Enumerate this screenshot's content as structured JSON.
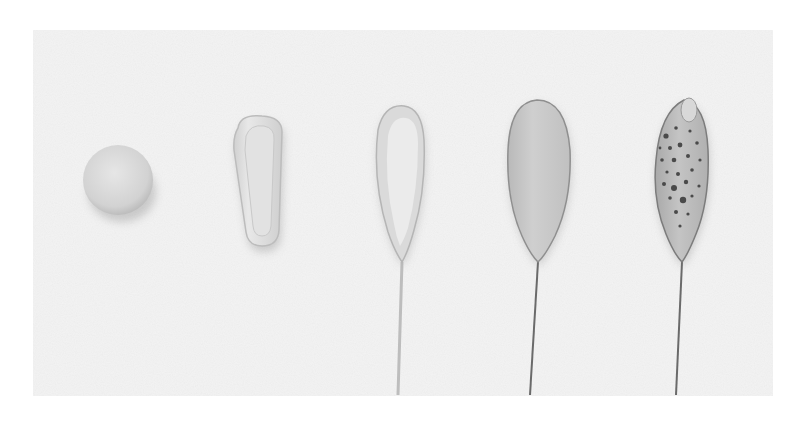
{
  "image": {
    "kind": "grayscale photograph",
    "subject": "five progressive stages of forming a petal on a wire",
    "background_color": "#f3f3f3",
    "page_color": "#ffffff",
    "stages": [
      {
        "step": 1,
        "shape": "ball",
        "cx": 118,
        "cy": 180,
        "r": 35,
        "fill": "#d9d9d9"
      },
      {
        "step": 2,
        "shape": "cupped-oblong",
        "x": 232,
        "y": 116,
        "w": 50,
        "h": 128,
        "fill": "#dedede"
      },
      {
        "step": 3,
        "shape": "hollowed-teardrop-on-wire",
        "cx": 396,
        "top": 106,
        "bottom": 262,
        "w": 54,
        "fill": "#e0e0e0",
        "wire_bottom": 395
      },
      {
        "step": 4,
        "shape": "flat-teardrop-on-wire",
        "cx": 538,
        "top": 100,
        "bottom": 262,
        "w": 66,
        "fill": "#cbcbcb",
        "wire_bottom": 395
      },
      {
        "step": 5,
        "shape": "spotted-teardrop-on-wire",
        "cx": 682,
        "top": 99,
        "bottom": 262,
        "w": 58,
        "fill": "#bdbdbd",
        "wire_bottom": 395,
        "spots_color": "#4a4a4a"
      }
    ]
  }
}
